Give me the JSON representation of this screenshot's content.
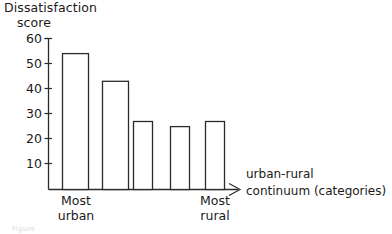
{
  "chart_data": {
    "type": "bar",
    "title": "",
    "ylabel_lines": [
      "Dissatisfaction",
      "score"
    ],
    "ylabel": "Dissatisfaction score",
    "xlabel_lines": [
      "urban-rural",
      "continuum (categories)"
    ],
    "xlabel": "urban-rural continuum (categories)",
    "categories": [
      "1",
      "2",
      "3",
      "4",
      "5"
    ],
    "category_axis_labels": [
      {
        "index": 0,
        "lines": [
          "Most",
          "urban"
        ]
      },
      {
        "index": 4,
        "lines": [
          "Most",
          "rural"
        ]
      }
    ],
    "values": [
      54,
      43,
      27,
      25,
      27
    ],
    "ylim": [
      0,
      62
    ],
    "yticks": [
      10,
      20,
      30,
      40,
      50,
      60
    ],
    "ytick_labels": [
      "10",
      "20",
      "30",
      "40",
      "50",
      "60"
    ],
    "xticks_shown": false,
    "grid": false,
    "legend": null,
    "bar_style": {
      "fill": "#ffffff",
      "stroke": "#2b2b2b",
      "stroke_width": 1.2
    },
    "axis_color": "#2b2b2b",
    "background": "#ffffff"
  },
  "figure": {
    "ghost_caption": "Figure"
  }
}
